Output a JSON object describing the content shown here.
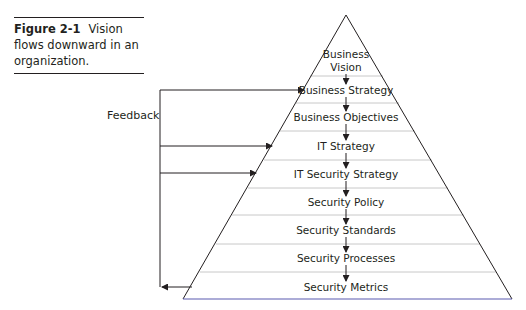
{
  "caption": {
    "figure_number": "Figure 2-1",
    "text": "Vision flows downward in an organization."
  },
  "feedback_label": "Feedback",
  "pyramid": {
    "layers": [
      {
        "label": "Business",
        "label2": "Vision"
      },
      {
        "label": "Business Strategy"
      },
      {
        "label": "Business Objectives"
      },
      {
        "label": "IT Strategy"
      },
      {
        "label": "IT Security Strategy"
      },
      {
        "label": "Security Policy"
      },
      {
        "label": "Security Standards"
      },
      {
        "label": "Security Processes"
      },
      {
        "label": "Security Metrics"
      }
    ],
    "feedback_targets": [
      "Business Strategy",
      "IT Strategy",
      "IT Security Strategy"
    ],
    "feedback_source": "Security Metrics"
  },
  "colors": {
    "line": "#231f20",
    "divider": "#c8c8c8",
    "base": "#5a5ab0"
  }
}
